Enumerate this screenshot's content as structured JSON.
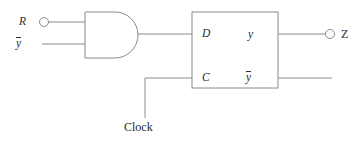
{
  "diagram": {
    "type": "logic-circuit-schematic",
    "stroke_color": "#8a8a8a",
    "text_color": "#2b2b2b",
    "background_color": "#ffffff"
  },
  "labels": {
    "input_r": "R",
    "input_ybar": "y",
    "ff_input_d": "D",
    "ff_input_c": "C",
    "ff_output_y": "y",
    "ff_output_ybar": "y",
    "output_z": "Z",
    "clock": "Clock"
  },
  "components": [
    {
      "name": "and-gate",
      "kind": "AND",
      "inputs": [
        "R",
        "y-bar"
      ],
      "output": "D"
    },
    {
      "name": "d-flip-flop",
      "kind": "D flip-flop",
      "input_pins": [
        "D",
        "C"
      ],
      "output_pins": [
        "y",
        "y-bar"
      ]
    }
  ],
  "terminals": [
    {
      "name": "r-input-terminal",
      "label": "R",
      "style": "open-circle"
    },
    {
      "name": "ybar-input-terminal",
      "label": "y",
      "overbar": true,
      "style": "plain-wire"
    },
    {
      "name": "z-output-terminal",
      "label": "Z",
      "style": "open-circle"
    },
    {
      "name": "ybar-output-terminal",
      "label": "y",
      "overbar": true,
      "style": "plain-wire"
    },
    {
      "name": "clock-terminal",
      "label": "Clock",
      "style": "plain-wire"
    }
  ],
  "nets": [
    {
      "name": "net-r",
      "from": "R terminal",
      "to": "AND gate input 1"
    },
    {
      "name": "net-ybar-feedback",
      "from": "y-bar",
      "to": "AND gate input 2"
    },
    {
      "name": "net-and-out",
      "from": "AND gate output",
      "to": "flip-flop D input"
    },
    {
      "name": "net-clock",
      "from": "Clock",
      "to": "flip-flop C input"
    },
    {
      "name": "net-y-out",
      "from": "flip-flop y output",
      "to": "Z terminal"
    },
    {
      "name": "net-ybar-out",
      "from": "flip-flop y-bar output",
      "to": "open end"
    }
  ]
}
